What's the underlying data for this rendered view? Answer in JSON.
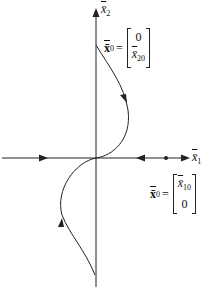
{
  "diagram": {
    "type": "phase-portrait",
    "axes": {
      "x_label": "x̄",
      "x_sub": "1",
      "y_label": "x̄",
      "y_sub": "2"
    },
    "initial_conditions": [
      {
        "label": "x̄",
        "label_sub": "0",
        "equals": "=",
        "vector": [
          "0",
          "x̄",
          "20"
        ],
        "top": "0",
        "bottom_main": "x̄",
        "bottom_sub": "20"
      },
      {
        "label": "x̄",
        "label_sub": "0",
        "equals": "=",
        "top_main": "x̄",
        "top_sub": "10",
        "bottom": "0"
      }
    ],
    "colors": {
      "stroke": "#222222",
      "background": "#ffffff"
    }
  }
}
